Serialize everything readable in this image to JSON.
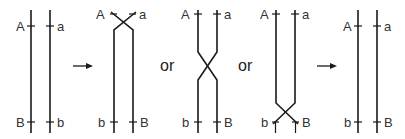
{
  "diagram": {
    "panels": [
      {
        "id": "parental",
        "top_labels": [
          "A",
          "a"
        ],
        "bottom_labels": [
          "B",
          "b"
        ],
        "crossover": "none"
      },
      {
        "id": "crossover-top",
        "top_labels": [
          "A",
          "a"
        ],
        "bottom_labels": [
          "b",
          "B"
        ],
        "crossover": "top"
      },
      {
        "id": "crossover-middle",
        "top_labels": [
          "A",
          "a"
        ],
        "bottom_labels": [
          "b",
          "B"
        ],
        "crossover": "middle"
      },
      {
        "id": "crossover-bottom",
        "top_labels": [
          "A",
          "a"
        ],
        "bottom_labels": [
          "b",
          "B"
        ],
        "crossover": "bottom"
      },
      {
        "id": "recombinant",
        "top_labels": [
          "A",
          "a"
        ],
        "bottom_labels": [
          "b",
          "B"
        ],
        "crossover": "none"
      }
    ],
    "connectors": [
      "arrow",
      "or",
      "or",
      "arrow"
    ],
    "or_label": "or",
    "colors": {
      "line": "#1a1a1a",
      "text": "#333333"
    }
  }
}
